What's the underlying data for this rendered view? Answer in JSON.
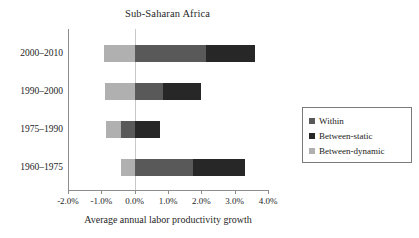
{
  "chart_data": {
    "type": "bar",
    "orientation": "horizontal",
    "stacked": true,
    "title": "Sub-Saharan Africa",
    "xlabel": "Average annual labor productivity growth",
    "ylabel": "",
    "categories": [
      "2000–2010",
      "1990–2000",
      "1975–1990",
      "1960–1975"
    ],
    "series": [
      {
        "name": "Within",
        "color": "#595959",
        "values": [
          2.15,
          0.85,
          0.4,
          1.75
        ]
      },
      {
        "name": "Between-static",
        "color": "#272727",
        "values": [
          1.45,
          1.15,
          0.75,
          1.55
        ]
      },
      {
        "name": "Between-dynamic",
        "color": "#b0b0b0",
        "values": [
          -0.93,
          -0.9,
          -0.45,
          -0.4
        ]
      }
    ],
    "segments": [
      {
        "category": "2000–2010",
        "parts": [
          {
            "name": "Between-dynamic",
            "start": -0.93,
            "end": 0.0
          },
          {
            "name": "Within",
            "start": 0.0,
            "end": 2.15
          },
          {
            "name": "Between-static",
            "start": 2.15,
            "end": 3.6
          }
        ]
      },
      {
        "category": "1990–2000",
        "parts": [
          {
            "name": "Between-dynamic",
            "start": -0.9,
            "end": 0.0
          },
          {
            "name": "Within",
            "start": 0.0,
            "end": 0.85
          },
          {
            "name": "Between-static",
            "start": 0.85,
            "end": 2.0
          }
        ]
      },
      {
        "category": "1975–1990",
        "parts": [
          {
            "name": "Between-dynamic",
            "start": -0.85,
            "end": -0.4
          },
          {
            "name": "Within",
            "start": -0.4,
            "end": 0.0
          },
          {
            "name": "Between-static",
            "start": 0.0,
            "end": 0.75
          }
        ]
      },
      {
        "category": "1960–1975",
        "parts": [
          {
            "name": "Between-dynamic",
            "start": -0.4,
            "end": 0.0
          },
          {
            "name": "Within",
            "start": 0.0,
            "end": 1.75
          },
          {
            "name": "Between-static",
            "start": 1.75,
            "end": 3.3
          }
        ]
      }
    ],
    "xlim": [
      -2.0,
      4.0
    ],
    "xticks": [
      -2.0,
      -1.0,
      0.0,
      1.0,
      2.0,
      3.0,
      4.0
    ],
    "xtick_labels": [
      "-2.0%",
      "-1.0%",
      "0.0%",
      "1.0%",
      "2.0%",
      "3.0%",
      "4.0%"
    ],
    "grid": false,
    "zero_line": true,
    "legend": {
      "position": "right",
      "entries": [
        {
          "label": "Within",
          "color": "#595959"
        },
        {
          "label": "Between-static",
          "color": "#272727"
        },
        {
          "label": "Between-dynamic",
          "color": "#b0b0b0"
        }
      ]
    }
  }
}
